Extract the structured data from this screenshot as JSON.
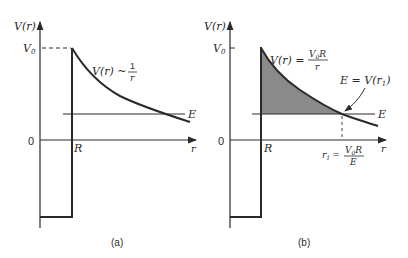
{
  "figure": {
    "colors": {
      "ink": "#2a2a2a",
      "shade": "#8a8a8a",
      "background": "#ffffff"
    },
    "panels": [
      {
        "id": "a",
        "caption": "(a)",
        "y_axis_label": "V(r)",
        "y_tick_v0": "V",
        "y_tick_v0_sub": "0",
        "y_tick_zero": "0",
        "x_axis_label": "r",
        "x_tick_R": "R",
        "energy_label": "E",
        "curve_label_lhs": "V(r) ~",
        "curve_label_num": "1",
        "curve_label_den": "r"
      },
      {
        "id": "b",
        "caption": "(b)",
        "y_axis_label": "V(r)",
        "y_tick_v0": "V",
        "y_tick_v0_sub": "0",
        "y_tick_zero": "0",
        "x_axis_label": "r",
        "x_tick_R": "R",
        "energy_label": "E",
        "curve_label_lhs": "V(r) =",
        "curve_label_num": "V",
        "curve_label_num_sub": "0",
        "curve_label_num_tail": "R",
        "curve_label_den": "r",
        "turning_point_label": "E = V(r",
        "turning_point_sub": "1",
        "turning_point_close": ")",
        "r1_label_lhs": "r",
        "r1_label_sub": "1",
        "r1_label_eq": "=",
        "r1_num": "V",
        "r1_num_sub": "0",
        "r1_num_tail": "R",
        "r1_den": "E"
      }
    ]
  }
}
